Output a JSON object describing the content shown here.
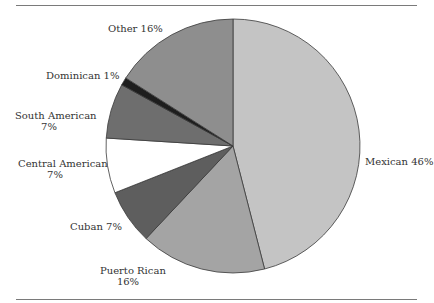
{
  "chart_data": {
    "type": "pie",
    "title": "",
    "categories": [
      "Mexican",
      "Puerto Rican",
      "Cuban",
      "Central American",
      "South American",
      "Dominican",
      "Other"
    ],
    "values": [
      46,
      16,
      7,
      7,
      7,
      1,
      16
    ],
    "unit": "%",
    "start_angle": "12 o'clock",
    "direction": "clockwise",
    "colors": [
      "#c4c4c4",
      "#a4a4a4",
      "#5e5e5e",
      "#ffffff",
      "#6e6e6e",
      "#1e1e1e",
      "#8e8e8e"
    ],
    "labels": [
      {
        "line1": "Mexican 46%",
        "line2": ""
      },
      {
        "line1": "Puerto Rican",
        "line2": "16%"
      },
      {
        "line1": "Cuban 7%",
        "line2": ""
      },
      {
        "line1": "Central American",
        "line2": "7%"
      },
      {
        "line1": "South  American",
        "line2": "7%"
      },
      {
        "line1": "Dominican 1%",
        "line2": ""
      },
      {
        "line1": "Other 16%",
        "line2": ""
      }
    ],
    "legend": "none (direct labels)"
  }
}
